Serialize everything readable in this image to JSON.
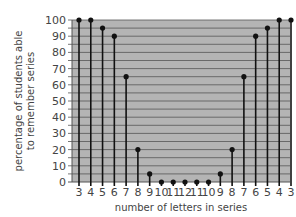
{
  "chart_data": {
    "type": "lollipop",
    "title": "",
    "xlabel": "number of letters in series",
    "ylabel": "percentage of students able to remember series",
    "ylabel_lines": [
      "percentage of students able",
      "to remember series"
    ],
    "categories": [
      "3",
      "4",
      "5",
      "6",
      "7",
      "8",
      "9",
      "10",
      "11",
      "12",
      "11",
      "10",
      "9",
      "8",
      "7",
      "6",
      "5",
      "4",
      "3"
    ],
    "values": [
      100,
      100,
      95,
      90,
      65,
      20,
      5,
      0,
      0,
      0,
      0,
      0,
      5,
      20,
      65,
      90,
      95,
      100,
      100
    ],
    "ylim": [
      0,
      100
    ],
    "yticks": [
      0,
      10,
      20,
      30,
      40,
      50,
      60,
      70,
      80,
      90,
      100
    ],
    "ytick_labels": [
      "0",
      "10",
      "20",
      "30",
      "40",
      "50",
      "60",
      "70",
      "80",
      "90",
      "100"
    ],
    "grid": "horizontal every 5",
    "legend": null
  },
  "colors": {
    "plot_background": "#b4b4b4",
    "gridline": "#555555",
    "stem": "#111111",
    "text": "#444444"
  }
}
